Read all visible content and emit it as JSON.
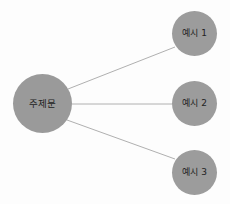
{
  "diagram": {
    "type": "hub-and-spoke",
    "canvas": {
      "width": 230,
      "height": 204,
      "background": "#fdfdfd"
    },
    "node_color": "#9a9a9a",
    "edge_color": "#b0b0b0",
    "text_color": "#232323",
    "center_node": {
      "id": "center",
      "label": "주제문",
      "cx": 43,
      "cy": 104,
      "r": 29.5
    },
    "leaf_nodes": [
      {
        "id": "ex-1",
        "label": "예시 1",
        "cx": 195,
        "cy": 33,
        "r": 22.5
      },
      {
        "id": "ex-2",
        "label": "예시 2",
        "cx": 195,
        "cy": 104,
        "r": 22.5
      },
      {
        "id": "ex-3",
        "label": "예시 3",
        "cx": 195,
        "cy": 172,
        "r": 22.5
      }
    ],
    "edges": [
      {
        "id": "edge-center-ex-1",
        "from": "center",
        "to": "ex-1",
        "x1": 68,
        "y1": 89,
        "x2": 175,
        "y2": 47
      },
      {
        "id": "edge-center-ex-2",
        "from": "center",
        "to": "ex-2",
        "x1": 72,
        "y1": 104,
        "x2": 172,
        "y2": 104
      },
      {
        "id": "edge-center-ex-3",
        "from": "center",
        "to": "ex-3",
        "x1": 67,
        "y1": 120,
        "x2": 175,
        "y2": 159
      }
    ]
  }
}
